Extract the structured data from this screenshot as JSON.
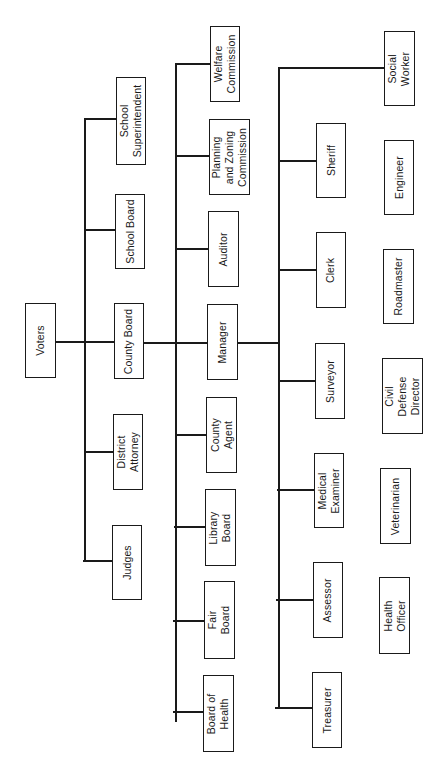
{
  "diagram": {
    "type": "organizational-chart",
    "orientation": "rotated-90-ccw",
    "colors": {
      "line": "#1a1a1a",
      "box_border": "#1a1a1a",
      "background": "#ffffff"
    },
    "nodes": [
      {
        "id": "voters",
        "label": "Voters",
        "level": 0,
        "x": 25,
        "y": 103,
        "w": 31,
        "h": 75
      },
      {
        "id": "school-superintendent",
        "label": "School\nSuperintendent",
        "level": 1,
        "parent": "voters",
        "x": 116,
        "y": 77,
        "w": 30,
        "h": 88
      },
      {
        "id": "school-board",
        "label": "School Board",
        "level": 1,
        "parent": "voters",
        "x": 115,
        "y": 194,
        "w": 30,
        "h": 75
      },
      {
        "id": "county-board",
        "label": "County Board",
        "level": 1,
        "parent": "voters",
        "x": 114,
        "y": 303,
        "w": 30,
        "h": 76
      },
      {
        "id": "district-attorney",
        "label": "District\nAttorney",
        "level": 1,
        "parent": "voters",
        "x": 113,
        "y": 414,
        "w": 30,
        "h": 76
      },
      {
        "id": "judges",
        "label": "Judges",
        "level": 1,
        "parent": "voters",
        "x": 112,
        "y": 525,
        "w": 30,
        "h": 75
      },
      {
        "id": "welfare-commission",
        "label": "Welfare\nCommission",
        "level": 2,
        "parent": "county-board",
        "x": 210,
        "y": 26,
        "w": 30,
        "h": 76
      },
      {
        "id": "planning-zoning-commission",
        "label": "Planning\nand Zoning\nCommission",
        "level": 2,
        "parent": "county-board",
        "x": 209,
        "y": 119,
        "w": 41,
        "h": 76
      },
      {
        "id": "auditor",
        "label": "Auditor",
        "level": 2,
        "parent": "county-board",
        "x": 208,
        "y": 211,
        "w": 31,
        "h": 76
      },
      {
        "id": "manager",
        "label": "Manager",
        "level": 2,
        "parent": "county-board",
        "x": 207,
        "y": 304,
        "w": 31,
        "h": 76
      },
      {
        "id": "county-agent",
        "label": "County\nAgent",
        "level": 2,
        "parent": "county-board",
        "x": 206,
        "y": 397,
        "w": 31,
        "h": 76
      },
      {
        "id": "library-board",
        "label": "Library\nBoard",
        "level": 2,
        "parent": "county-board",
        "x": 205,
        "y": 489,
        "w": 31,
        "h": 77
      },
      {
        "id": "fair-board",
        "label": "Fair\nBoard",
        "level": 2,
        "parent": "county-board",
        "x": 204,
        "y": 581,
        "w": 31,
        "h": 78
      },
      {
        "id": "board-of-health",
        "label": "Board of\nHealth",
        "level": 2,
        "parent": "county-board",
        "x": 203,
        "y": 675,
        "w": 31,
        "h": 77
      },
      {
        "id": "social-worker",
        "label": "Social\nWorker",
        "level": 3,
        "parent": "manager",
        "x": 384,
        "y": 31,
        "w": 31,
        "h": 75
      },
      {
        "id": "sheriff",
        "label": "Sheriff",
        "level": 3,
        "parent": "manager",
        "x": 316,
        "y": 123,
        "w": 30,
        "h": 75
      },
      {
        "id": "clerk",
        "label": "Clerk",
        "level": 3,
        "parent": "manager",
        "x": 316,
        "y": 232,
        "w": 30,
        "h": 76
      },
      {
        "id": "surveyor",
        "label": "Surveyor",
        "level": 3,
        "parent": "manager",
        "x": 315,
        "y": 343,
        "w": 30,
        "h": 76
      },
      {
        "id": "medical-examiner",
        "label": "Medical\nExaminer",
        "level": 3,
        "parent": "manager",
        "x": 314,
        "y": 453,
        "w": 30,
        "h": 75
      },
      {
        "id": "assessor",
        "label": "Assessor",
        "level": 3,
        "parent": "manager",
        "x": 313,
        "y": 562,
        "w": 30,
        "h": 76
      },
      {
        "id": "treasurer",
        "label": "Treasurer",
        "level": 3,
        "parent": "manager",
        "x": 312,
        "y": 672,
        "w": 30,
        "h": 76
      },
      {
        "id": "engineer",
        "label": "Engineer",
        "level": 3,
        "parent": null,
        "x": 384,
        "y": 140,
        "w": 30,
        "h": 75
      },
      {
        "id": "roadmaster",
        "label": "Roadmaster",
        "level": 3,
        "parent": null,
        "x": 383,
        "y": 249,
        "w": 31,
        "h": 75
      },
      {
        "id": "civil-defense-director",
        "label": "Civil\nDefense\nDirector",
        "level": 3,
        "parent": null,
        "x": 382,
        "y": 358,
        "w": 41,
        "h": 76
      },
      {
        "id": "veterinarian",
        "label": "Veterinarian",
        "level": 3,
        "parent": null,
        "x": 380,
        "y": 468,
        "w": 31,
        "h": 76
      },
      {
        "id": "health-officer",
        "label": "Health\nOfficer",
        "level": 3,
        "parent": null,
        "x": 379,
        "y": 577,
        "w": 31,
        "h": 77
      }
    ],
    "lines": [
      {
        "id": "voters-to-trunk1",
        "x": 55,
        "y": 141,
        "w": 30,
        "h": 2
      },
      {
        "id": "trunk1",
        "x": 84,
        "y": 118,
        "w": 2,
        "h": 444
      },
      {
        "id": "trunk1-school-superintendent",
        "x": 84,
        "y": 118,
        "w": 32,
        "h": 2
      },
      {
        "id": "trunk1-school-board",
        "x": 84,
        "y": 229,
        "w": 31,
        "h": 2
      },
      {
        "id": "trunk1-county-board",
        "x": 84,
        "y": 141,
        "w": 31,
        "h": 2
      },
      {
        "id": "trunk1-district-attorney",
        "x": 84,
        "y": 451,
        "w": 30,
        "h": 2
      },
      {
        "id": "trunk1-judges",
        "x": 83,
        "y": 560,
        "w": 30,
        "h": 2
      },
      {
        "id": "county-board-to-trunk2",
        "x": 144,
        "y": 342,
        "w": 32,
        "h": 2
      },
      {
        "id": "trunk2",
        "x": 175,
        "y": 63,
        "w": 2,
        "h": 659
      },
      {
        "id": "trunk2-welfare",
        "x": 175,
        "y": 63,
        "w": 35,
        "h": 2
      },
      {
        "id": "trunk2-planning",
        "x": 175,
        "y": 155,
        "w": 34,
        "h": 2
      },
      {
        "id": "trunk2-auditor",
        "x": 175,
        "y": 248,
        "w": 33,
        "h": 2
      },
      {
        "id": "trunk2-manager",
        "x": 175,
        "y": 342,
        "w": 32,
        "h": 2
      },
      {
        "id": "trunk2-county-agent",
        "x": 175,
        "y": 434,
        "w": 31,
        "h": 2
      },
      {
        "id": "trunk2-library",
        "x": 174,
        "y": 526,
        "w": 31,
        "h": 2
      },
      {
        "id": "trunk2-fair",
        "x": 173,
        "y": 620,
        "w": 31,
        "h": 2
      },
      {
        "id": "trunk2-health",
        "x": 173,
        "y": 711,
        "w": 30,
        "h": 2
      },
      {
        "id": "manager-to-trunk3",
        "x": 238,
        "y": 342,
        "w": 41,
        "h": 2
      },
      {
        "id": "trunk3",
        "x": 278,
        "y": 67,
        "w": 2,
        "h": 642
      },
      {
        "id": "trunk3-social-worker",
        "x": 278,
        "y": 67,
        "w": 106,
        "h": 2
      },
      {
        "id": "trunk3-sheriff",
        "x": 278,
        "y": 160,
        "w": 38,
        "h": 2
      },
      {
        "id": "trunk3-clerk",
        "x": 278,
        "y": 269,
        "w": 38,
        "h": 2
      },
      {
        "id": "trunk3-surveyor",
        "x": 278,
        "y": 380,
        "w": 37,
        "h": 2
      },
      {
        "id": "trunk3-medical-examiner",
        "x": 277,
        "y": 489,
        "w": 37,
        "h": 2
      },
      {
        "id": "trunk3-assessor",
        "x": 276,
        "y": 599,
        "w": 37,
        "h": 2
      },
      {
        "id": "trunk3-treasurer",
        "x": 275,
        "y": 707,
        "w": 37,
        "h": 2
      }
    ]
  }
}
